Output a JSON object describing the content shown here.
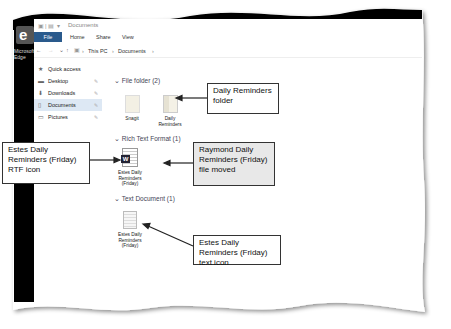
{
  "window": {
    "title": "Documents",
    "ribbon_tabs": [
      "File",
      "Home",
      "Share",
      "View"
    ]
  },
  "desktop": {
    "icon_label": "Microsoft Edge"
  },
  "address_bar": {
    "breadcrumb": [
      "This PC",
      "Documents"
    ]
  },
  "navigation_pane": {
    "items": [
      {
        "label": "Quick access",
        "icon": "star-icon"
      },
      {
        "label": "Desktop",
        "icon": "desktop-icon",
        "pinned": true
      },
      {
        "label": "Downloads",
        "icon": "download-icon",
        "pinned": true
      },
      {
        "label": "Documents",
        "icon": "documents-icon",
        "pinned": true,
        "selected": true
      },
      {
        "label": "Pictures",
        "icon": "pictures-icon",
        "pinned": true
      },
      {
        "label": "Network",
        "icon": "network-icon"
      }
    ]
  },
  "content": {
    "groups": [
      {
        "header": "File folder (2)",
        "items": [
          {
            "label": "Snagit",
            "type": "folder"
          },
          {
            "label": "Daily Reminders",
            "type": "folder"
          }
        ]
      },
      {
        "header": "Rich Text Format (1)",
        "items": [
          {
            "label": "Estes Daily Reminders (Friday)",
            "type": "rtf"
          }
        ]
      },
      {
        "header": "Text Document (1)",
        "items": [
          {
            "label": "Estes Daily Reminders (Friday)",
            "type": "txt"
          }
        ]
      }
    ]
  },
  "callouts": {
    "daily_reminders_folder": "Daily Reminders folder",
    "rtf_icon": "Estes Daily Reminders (Friday) RTF icon",
    "file_moved": "Raymond Daily Reminders (Friday) file moved",
    "text_icon": "Estes Daily Reminders (Friday) text icon"
  }
}
